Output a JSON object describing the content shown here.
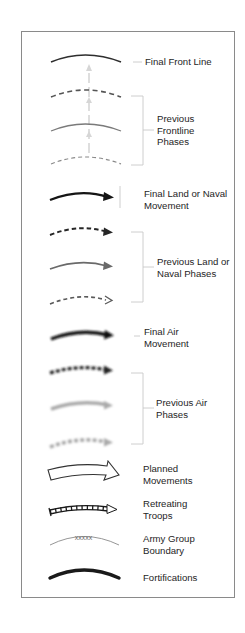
{
  "legend": {
    "items": [
      {
        "id": "final-front-line",
        "label_lines": [
          "Final Front Line"
        ],
        "symbol": "solid-curve-dark"
      },
      {
        "id": "previous-frontline-phases",
        "label_lines": [
          "Previous",
          "Frontline",
          "Phases"
        ],
        "symbol": "dashed/solid/dashed-curves-gray"
      },
      {
        "id": "final-land-naval-movement",
        "label_lines": [
          "Final Land or Naval",
          "Movement"
        ],
        "symbol": "solid-arrow-black"
      },
      {
        "id": "previous-land-naval-phases",
        "label_lines": [
          "Previous Land or",
          "Naval Phases"
        ],
        "symbol": "dashed/solid/dashed-arrows-gray"
      },
      {
        "id": "final-air-movement",
        "label_lines": [
          "Final Air",
          "Movement"
        ],
        "symbol": "blurred-arrow-black"
      },
      {
        "id": "previous-air-phases",
        "label_lines": [
          "Previous Air",
          "Phases"
        ],
        "symbol": "blurred-dashed/solid/dashed-arrows-gray"
      },
      {
        "id": "planned-movements",
        "label_lines": [
          "Planned",
          "Movements"
        ],
        "symbol": "hollow-wide-arrow"
      },
      {
        "id": "retreating-troops",
        "label_lines": [
          "Retreating",
          "Troops"
        ],
        "symbol": "ladder-arrow"
      },
      {
        "id": "army-group-boundary",
        "label_lines": [
          "Army Group",
          "Boundary"
        ],
        "symbol": "thin-curve-with-xxxxx",
        "marker_text": "xxxxx"
      },
      {
        "id": "fortifications",
        "label_lines": [
          "Fortifications"
        ],
        "symbol": "thick-curve-black"
      }
    ]
  },
  "colors": {
    "border": "#8a8a8a",
    "dark": "#2a2a2a",
    "mid_gray": "#6e6e6e",
    "light_gray": "#a8a8a8",
    "leader": "#c8c8c8",
    "text": "#1e1e1e"
  }
}
